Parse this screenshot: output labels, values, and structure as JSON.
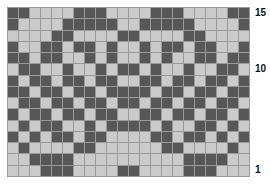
{
  "chart_data": {
    "type": "heatmap",
    "title": "",
    "columns": 22,
    "rows": 15,
    "colors": {
      "dark": "#575757",
      "light": "#cbcbcb",
      "grid": "#9a9a9a"
    },
    "row_labels": [
      {
        "row": 15,
        "text": "15"
      },
      {
        "row": 10,
        "text": "10"
      },
      {
        "row": 1,
        "text": "1"
      }
    ],
    "pattern_top_to_bottom": [
      "DDLLLLDDDLLLLDDDLLLLDD",
      "DLLLLDDDDDLLDDDDDLLLLD",
      "LLLLDDLLLLDDLLLLDDLLLL",
      "DLLDDLDDLDLLDLDDLDDLLD",
      "DDLDDLLDLDLLDLDLLDDLDD",
      "LDDLLDLLDLDDLDLLDLLDDL",
      "DLDDLDDLDDLLDDLDDLDDLD",
      "DDLDDLDDLDDDDLDDLDDLDD",
      "LDDLDDLDDLDDLDDLDDLDDL",
      "DLDDLDDLDDLLDDLDDLDDLD",
      "LDLDDLLDLDDDDLDLLDDLDL",
      "DLDLDDLDDLLLLDDLDDLDLD",
      "LDLLLLDDLLLLLLDDLLLLDL",
      "LLDDDDLLLLLLLLLLDDDDLL",
      "LLLDDDLLLLDDLLLLDDDLLL"
    ]
  }
}
